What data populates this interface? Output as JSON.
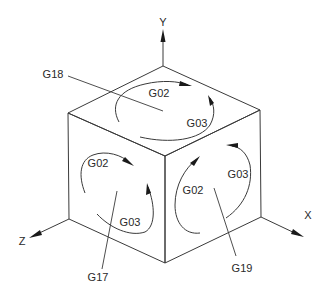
{
  "diagram": {
    "title": "",
    "axes": {
      "y": {
        "label": "Y"
      },
      "x": {
        "label": "X"
      },
      "z": {
        "label": "Z"
      }
    },
    "planes": {
      "top": {
        "plane_label": "G18",
        "cw_label": "G02",
        "ccw_label": "G03"
      },
      "front_left": {
        "plane_label": "G17",
        "cw_label": "G02",
        "ccw_label": "G03"
      },
      "front_right": {
        "plane_label": "G19",
        "cw_label": "G02",
        "ccw_label": "G03"
      }
    },
    "colors": {
      "line": "#3a3a3a",
      "text": "#2a2a2a",
      "background": "#ffffff"
    }
  }
}
